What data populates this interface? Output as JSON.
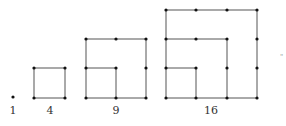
{
  "figures": [
    {
      "label": "1",
      "n": 1
    },
    {
      "label": "4",
      "n": 2
    },
    {
      "label": "9",
      "n": 3
    },
    {
      "label": "16",
      "n": 4
    }
  ],
  "colors": {
    "line": "#555555",
    "dot": "#111111",
    "label": "#333333"
  },
  "stray_mark": "\""
}
